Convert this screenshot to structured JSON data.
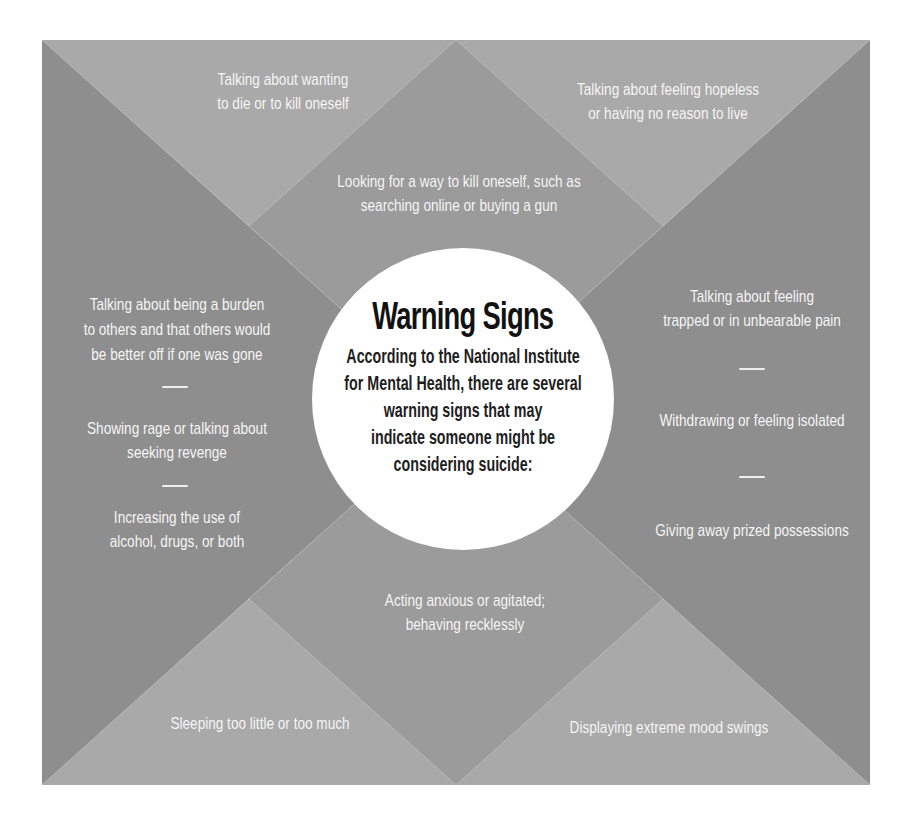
{
  "colors": {
    "page_bg": "#ffffff",
    "panel_light": "#a9a9a9",
    "panel_medium": "#9b9b9b",
    "panel_dark": "#8e8e8e",
    "circle_bg": "#ffffff",
    "title_text": "#121212",
    "body_text": "#1e1e1e",
    "item_text": "#f7f7f7",
    "dash": "#efefef"
  },
  "circle": {
    "title": "Warning Signs",
    "body_lines": [
      "According to the National Institute",
      "for Mental Health, there are several",
      "warning signs that may",
      "indicate someone might be",
      "considering suicide:"
    ]
  },
  "items": {
    "top_left": [
      "Talking about wanting",
      "to die or to kill oneself"
    ],
    "top_right": [
      "Talking about feeling hopeless",
      "or having no reason to live"
    ],
    "top_center": [
      "Looking for a way to kill oneself, such as",
      "searching online or buying a gun"
    ],
    "left_column": {
      "group1": [
        "Talking about being a burden",
        "to others and that others would",
        "be better off if one was gone"
      ],
      "group2": [
        "Showing rage or talking about",
        "seeking revenge"
      ],
      "group3": [
        "Increasing the use of",
        "alcohol, drugs, or both"
      ]
    },
    "right_column": {
      "group1": [
        "Talking about feeling",
        "trapped or in unbearable pain"
      ],
      "group2": [
        "Withdrawing or feeling isolated"
      ],
      "group3": [
        "Giving away prized possessions"
      ]
    },
    "bottom_center": [
      "Acting anxious or agitated;",
      "behaving recklessly"
    ],
    "bottom_left": [
      "Sleeping too little or too much"
    ],
    "bottom_right": [
      "Displaying extreme mood swings"
    ]
  }
}
